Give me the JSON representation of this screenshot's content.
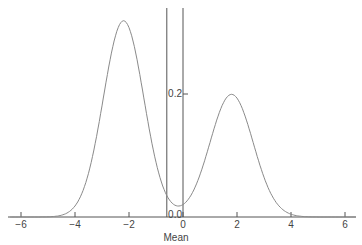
{
  "chart_data": {
    "type": "line",
    "title": "",
    "xlabel": "Mean",
    "ylabel": "",
    "xlim": [
      -6.5,
      6.5
    ],
    "ylim": [
      0,
      0.33
    ],
    "grid": false,
    "legend": null,
    "x_ticks": [
      -6,
      -4,
      -2,
      0,
      2,
      4,
      6
    ],
    "x_tick_labels": [
      "−6",
      "−4",
      "−2",
      "0",
      "2",
      "4",
      "6"
    ],
    "y_ticks": [
      0.0,
      0.2
    ],
    "y_tick_labels": [
      "0.0",
      "0.2"
    ],
    "series": [
      {
        "name": "bimodal density",
        "description": "Mixture of two normals: peaks near x=-2.2 (height ~0.32) and x=1.8 (height ~0.21), minimum ~0.02 near x=0",
        "components": [
          {
            "mean": -2.2,
            "sd": 0.75,
            "weight": 0.6
          },
          {
            "mean": 1.8,
            "sd": 0.8,
            "weight": 0.4
          }
        ],
        "key_points": [
          {
            "x": -6,
            "y": 0.0
          },
          {
            "x": -4,
            "y": 0.02
          },
          {
            "x": -2.2,
            "y": 0.32
          },
          {
            "x": 0,
            "y": 0.02
          },
          {
            "x": 1.8,
            "y": 0.21
          },
          {
            "x": 4,
            "y": 0.01
          },
          {
            "x": 6,
            "y": 0.0
          }
        ]
      }
    ],
    "annotations": [
      {
        "type": "vline",
        "x": -0.6,
        "label": "Mean"
      },
      {
        "type": "vline",
        "x": 0,
        "note": "y-axis"
      }
    ]
  },
  "colors": {
    "curve": "#8a8a8a",
    "axis": "#555555",
    "text": "#444444"
  }
}
